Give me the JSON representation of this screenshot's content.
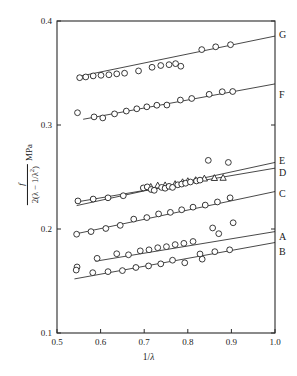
{
  "figure": {
    "title": "",
    "background": "#ffffff",
    "ink": "#1a1a1a"
  },
  "axes": {
    "x": {
      "label_text": "1/λ",
      "label_prefix": "1/",
      "label_symbol": "λ",
      "min": 0.5,
      "max": 1.0,
      "ticks": [
        0.5,
        0.6,
        0.7,
        0.8,
        0.9,
        1.0
      ],
      "tick_labels": [
        "0.5",
        "0.6",
        "0.7",
        "0.8",
        "0.9",
        "1.0"
      ]
    },
    "y": {
      "label_numerator": "f",
      "label_denominator": "2(λ − 1/λ",
      "label_denominator_sup": "2",
      "label_denominator_close": ")",
      "label_unit": "MPa",
      "min": 0.1,
      "max": 0.4,
      "ticks": [
        0.1,
        0.2,
        0.3,
        0.4
      ],
      "tick_labels": [
        "0.1",
        "0.2",
        "0.3",
        "0.4"
      ]
    }
  },
  "chart_data": {
    "type": "scatter",
    "title": "",
    "xlabel": "1/λ",
    "ylabel": "f / 2(λ − 1/λ²)  MPa",
    "xlim": [
      0.5,
      1.0
    ],
    "ylim": [
      0.1,
      0.4
    ],
    "xticks": [
      0.5,
      0.6,
      0.7,
      0.8,
      0.9,
      1.0
    ],
    "yticks": [
      0.1,
      0.2,
      0.3,
      0.4
    ],
    "grid": false,
    "legend": "right-edge-labels",
    "marker_types": [
      "open-circle",
      "half-filled-circle",
      "open-triangle"
    ],
    "series": [
      {
        "name": "G",
        "label": "G",
        "marker": "circle",
        "label_x": 1.02,
        "label_y": 0.3875,
        "fit_line": {
          "x1": 0.548,
          "y1": 0.3465,
          "x2": 1.0,
          "y2": 0.3855
        },
        "points": [
          {
            "x": 0.552,
            "y": 0.3455,
            "m": "half"
          },
          {
            "x": 0.566,
            "y": 0.3462,
            "m": "half"
          },
          {
            "x": 0.583,
            "y": 0.3472,
            "m": "half"
          },
          {
            "x": 0.601,
            "y": 0.3478,
            "m": "open"
          },
          {
            "x": 0.619,
            "y": 0.3483,
            "m": "open"
          },
          {
            "x": 0.637,
            "y": 0.3492,
            "m": "half"
          },
          {
            "x": 0.655,
            "y": 0.3498,
            "m": "half"
          },
          {
            "x": 0.687,
            "y": 0.352,
            "m": "open"
          },
          {
            "x": 0.718,
            "y": 0.3555,
            "m": "half"
          },
          {
            "x": 0.738,
            "y": 0.3572,
            "m": "half"
          },
          {
            "x": 0.757,
            "y": 0.358,
            "m": "open"
          },
          {
            "x": 0.772,
            "y": 0.359,
            "m": "half"
          },
          {
            "x": 0.784,
            "y": 0.3565,
            "m": "open"
          },
          {
            "x": 0.832,
            "y": 0.3725,
            "m": "half"
          },
          {
            "x": 0.864,
            "y": 0.3752,
            "m": "half"
          },
          {
            "x": 0.898,
            "y": 0.3772,
            "m": "half"
          }
        ]
      },
      {
        "name": "F",
        "label": "F",
        "marker": "circle",
        "label_x": 1.02,
        "label_y": 0.329,
        "fit_line": {
          "x1": 0.56,
          "y1": 0.3055,
          "x2": 1.0,
          "y2": 0.3395
        },
        "points": [
          {
            "x": 0.547,
            "y": 0.3118,
            "m": "open"
          },
          {
            "x": 0.585,
            "y": 0.3078,
            "m": "open"
          },
          {
            "x": 0.605,
            "y": 0.3068,
            "m": "open"
          },
          {
            "x": 0.632,
            "y": 0.3107,
            "m": "half"
          },
          {
            "x": 0.659,
            "y": 0.3134,
            "m": "half"
          },
          {
            "x": 0.683,
            "y": 0.3156,
            "m": "half"
          },
          {
            "x": 0.706,
            "y": 0.3175,
            "m": "half"
          },
          {
            "x": 0.729,
            "y": 0.319,
            "m": "half"
          },
          {
            "x": 0.752,
            "y": 0.3192,
            "m": "half"
          },
          {
            "x": 0.783,
            "y": 0.324,
            "m": "half"
          },
          {
            "x": 0.809,
            "y": 0.3255,
            "m": "half"
          },
          {
            "x": 0.849,
            "y": 0.3295,
            "m": "half"
          },
          {
            "x": 0.879,
            "y": 0.332,
            "m": "half"
          },
          {
            "x": 0.903,
            "y": 0.3322,
            "m": "half"
          }
        ]
      },
      {
        "name": "E",
        "label": "E",
        "marker": "circle",
        "label_x": 1.02,
        "label_y": 0.266,
        "fit_line": {
          "x1": 0.545,
          "y1": 0.2225,
          "x2": 1.0,
          "y2": 0.264
        },
        "points": []
      },
      {
        "name": "D",
        "label": "D",
        "marker": "triangle",
        "label_x": 1.02,
        "label_y": 0.254,
        "fit_line": {
          "x1": 0.545,
          "y1": 0.226,
          "x2": 1.0,
          "y2": 0.2585
        },
        "points": [
          {
            "x": 0.715,
            "y": 0.2405,
            "m": "tri"
          },
          {
            "x": 0.731,
            "y": 0.2418,
            "m": "tri"
          },
          {
            "x": 0.748,
            "y": 0.242,
            "m": "tri"
          },
          {
            "x": 0.771,
            "y": 0.2432,
            "m": "tri"
          },
          {
            "x": 0.788,
            "y": 0.245,
            "m": "tri"
          },
          {
            "x": 0.8,
            "y": 0.246,
            "m": "tri"
          },
          {
            "x": 0.818,
            "y": 0.247,
            "m": "tri"
          },
          {
            "x": 0.838,
            "y": 0.2485,
            "m": "tri"
          },
          {
            "x": 0.861,
            "y": 0.249,
            "m": "tri"
          },
          {
            "x": 0.881,
            "y": 0.2492,
            "m": "tri"
          }
        ]
      },
      {
        "name": "C",
        "label": "C",
        "marker": "circle",
        "label_x": 1.02,
        "label_y": 0.2345,
        "fit_line": {
          "x1": 0.545,
          "y1": 0.1955,
          "x2": 1.0,
          "y2": 0.236
        },
        "points": [
          {
            "x": 0.545,
            "y": 0.195,
            "m": "open"
          },
          {
            "x": 0.578,
            "y": 0.1975,
            "m": "half"
          },
          {
            "x": 0.612,
            "y": 0.2005,
            "m": "half"
          },
          {
            "x": 0.645,
            "y": 0.2035,
            "m": "half"
          },
          {
            "x": 0.676,
            "y": 0.2095,
            "m": "half"
          },
          {
            "x": 0.706,
            "y": 0.211,
            "m": "half"
          },
          {
            "x": 0.733,
            "y": 0.2145,
            "m": "half"
          },
          {
            "x": 0.76,
            "y": 0.216,
            "m": "half"
          },
          {
            "x": 0.786,
            "y": 0.2185,
            "m": "half"
          },
          {
            "x": 0.812,
            "y": 0.221,
            "m": "half"
          },
          {
            "x": 0.84,
            "y": 0.223,
            "m": "half"
          },
          {
            "x": 0.868,
            "y": 0.226,
            "m": "half"
          },
          {
            "x": 0.897,
            "y": 0.23,
            "m": "half"
          }
        ]
      },
      {
        "name": "A",
        "label": "A",
        "marker": "circle",
        "label_x": 1.02,
        "label_y": 0.1925,
        "fit_line": {
          "x1": 0.588,
          "y1": 0.169,
          "x2": 1.0,
          "y2": 0.1975
        },
        "points": [
          {
            "x": 0.546,
            "y": 0.1635,
            "m": "open"
          },
          {
            "x": 0.592,
            "y": 0.1718,
            "m": "open"
          },
          {
            "x": 0.637,
            "y": 0.1762,
            "m": "open"
          },
          {
            "x": 0.664,
            "y": 0.1752,
            "m": "open"
          },
          {
            "x": 0.691,
            "y": 0.179,
            "m": "open"
          },
          {
            "x": 0.711,
            "y": 0.18,
            "m": "open"
          },
          {
            "x": 0.731,
            "y": 0.182,
            "m": "open"
          },
          {
            "x": 0.751,
            "y": 0.183,
            "m": "open"
          },
          {
            "x": 0.771,
            "y": 0.185,
            "m": "open"
          },
          {
            "x": 0.791,
            "y": 0.1862,
            "m": "open"
          },
          {
            "x": 0.812,
            "y": 0.188,
            "m": "open"
          },
          {
            "x": 0.833,
            "y": 0.171,
            "m": "open"
          },
          {
            "x": 0.857,
            "y": 0.201,
            "m": "open"
          },
          {
            "x": 0.871,
            "y": 0.1955,
            "m": "open"
          },
          {
            "x": 0.904,
            "y": 0.206,
            "m": "open"
          }
        ]
      },
      {
        "name": "B",
        "label": "B",
        "marker": "circle",
        "label_x": 1.02,
        "label_y": 0.178,
        "fit_line": {
          "x1": 0.54,
          "y1": 0.152,
          "x2": 1.0,
          "y2": 0.187
        },
        "points": [
          {
            "x": 0.544,
            "y": 0.1605,
            "m": "open"
          },
          {
            "x": 0.582,
            "y": 0.158,
            "m": "open"
          },
          {
            "x": 0.617,
            "y": 0.159,
            "m": "open"
          },
          {
            "x": 0.65,
            "y": 0.16,
            "m": "open"
          },
          {
            "x": 0.681,
            "y": 0.163,
            "m": "half"
          },
          {
            "x": 0.71,
            "y": 0.1645,
            "m": "half"
          },
          {
            "x": 0.738,
            "y": 0.1665,
            "m": "half"
          },
          {
            "x": 0.765,
            "y": 0.17,
            "m": "open"
          },
          {
            "x": 0.793,
            "y": 0.1675,
            "m": "open"
          },
          {
            "x": 0.828,
            "y": 0.176,
            "m": "open"
          },
          {
            "x": 0.862,
            "y": 0.1782,
            "m": "half"
          },
          {
            "x": 0.896,
            "y": 0.18,
            "m": "half"
          }
        ]
      },
      {
        "name": "E-cluster",
        "label": "",
        "marker": "circle",
        "is_cluster": true,
        "points": [
          {
            "x": 0.548,
            "y": 0.227,
            "m": "half"
          },
          {
            "x": 0.583,
            "y": 0.2288,
            "m": "half"
          },
          {
            "x": 0.617,
            "y": 0.23,
            "m": "half"
          },
          {
            "x": 0.652,
            "y": 0.232,
            "m": "half"
          },
          {
            "x": 0.698,
            "y": 0.2395,
            "m": "half"
          },
          {
            "x": 0.707,
            "y": 0.2405,
            "m": "half"
          },
          {
            "x": 0.716,
            "y": 0.238,
            "m": "half"
          },
          {
            "x": 0.723,
            "y": 0.2372,
            "m": "half"
          },
          {
            "x": 0.74,
            "y": 0.24,
            "m": "half"
          },
          {
            "x": 0.748,
            "y": 0.2392,
            "m": "half"
          },
          {
            "x": 0.757,
            "y": 0.241,
            "m": "half"
          },
          {
            "x": 0.765,
            "y": 0.24,
            "m": "half"
          },
          {
            "x": 0.777,
            "y": 0.2425,
            "m": "half"
          },
          {
            "x": 0.786,
            "y": 0.2432,
            "m": "half"
          },
          {
            "x": 0.795,
            "y": 0.244,
            "m": "half"
          },
          {
            "x": 0.806,
            "y": 0.2452,
            "m": "half"
          },
          {
            "x": 0.82,
            "y": 0.2462,
            "m": "half"
          },
          {
            "x": 0.828,
            "y": 0.247,
            "m": "half"
          },
          {
            "x": 0.847,
            "y": 0.266,
            "m": "open"
          },
          {
            "x": 0.893,
            "y": 0.264,
            "m": "open"
          }
        ]
      }
    ]
  }
}
